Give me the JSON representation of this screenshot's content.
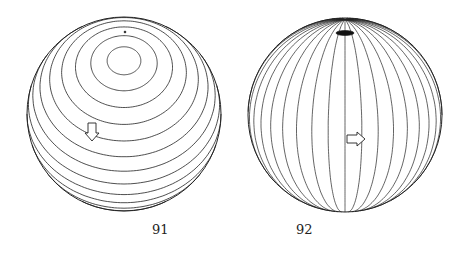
{
  "figures": [
    {
      "label": "91",
      "kind": "sphere-latitude-circles",
      "arrow": "down"
    },
    {
      "label": "92",
      "kind": "sphere-meridians",
      "arrow": "right"
    }
  ],
  "colors": {
    "stroke": "#222222",
    "background": "#ffffff"
  }
}
